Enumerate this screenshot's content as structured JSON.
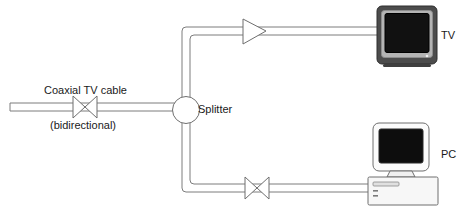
{
  "diagram": {
    "labels": {
      "coax_cable": "Coaxial TV cable",
      "bidirectional": "(bidirectional)",
      "splitter": "Splitter",
      "tv": "TV",
      "pc": "PC"
    },
    "nodes": [
      {
        "id": "cable-end",
        "name": "cable-terminator",
        "kind": "line-end",
        "x": 10,
        "y": 107
      },
      {
        "id": "bowtie-main",
        "name": "bidirectional-valve",
        "kind": "bowtie",
        "x": 85,
        "y": 107
      },
      {
        "id": "splitter",
        "name": "splitter",
        "kind": "circle",
        "x": 186,
        "y": 110,
        "r": 13
      },
      {
        "id": "amp-tv",
        "name": "amplifier",
        "kind": "triangle-right",
        "x": 257,
        "y": 32
      },
      {
        "id": "bowtie-pc",
        "name": "bidirectional-valve",
        "kind": "bowtie",
        "x": 257,
        "y": 187
      },
      {
        "id": "tv",
        "name": "television",
        "kind": "crt-tv",
        "x": 375,
        "y": 5
      },
      {
        "id": "pc",
        "name": "personal-computer",
        "kind": "desktop-pc",
        "x": 370,
        "y": 122
      }
    ],
    "edges": [
      {
        "from": "cable-end",
        "to": "splitter",
        "style": "double-line",
        "direction": "bidirectional"
      },
      {
        "from": "splitter",
        "to": "tv",
        "style": "double-line",
        "direction": "downstream"
      },
      {
        "from": "splitter",
        "to": "pc",
        "style": "double-line",
        "direction": "bidirectional"
      }
    ],
    "colors": {
      "line": "#7d7d7d",
      "text": "#1a1a1a",
      "tv_body": "#4a4a4a",
      "tv_bezel": "#9a9a9a",
      "screen": "#0a0a0a",
      "pc_body": "#f2f2f2",
      "pc_outline": "#6f6f6f",
      "background": "#ffffff"
    }
  }
}
